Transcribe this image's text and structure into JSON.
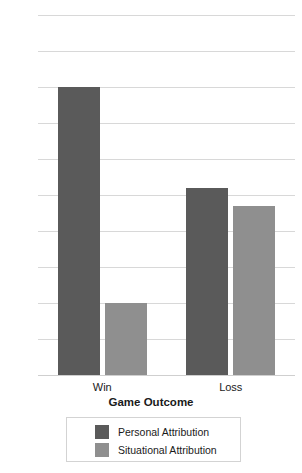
{
  "chart_data": {
    "type": "bar",
    "title": "",
    "xlabel": "Game Outcome",
    "ylabel": "",
    "categories": [
      "Win",
      "Loss"
    ],
    "series": [
      {
        "name": "Personal Attribution",
        "values": [
          80,
          52
        ],
        "color": "#5a5a5a"
      },
      {
        "name": "Situational Attribution",
        "values": [
          20,
          47
        ],
        "color": "#8f8f8f"
      }
    ],
    "ylim": [
      0,
      100
    ],
    "yticks": [
      0,
      10,
      20,
      30,
      40,
      50,
      60,
      70,
      80,
      90,
      100
    ],
    "ytick_labels": [
      "0",
      "10",
      "20",
      "30",
      "40",
      "50",
      "60",
      "70",
      "80",
      "90",
      "100"
    ],
    "grid": true,
    "legend_position": "bottom",
    "gridline_color": "#d8d8d8"
  },
  "legend": {
    "entries": [
      {
        "label": "Personal Attribution"
      },
      {
        "label": "Situational Attribution"
      }
    ]
  },
  "axes": {
    "x_title": "Game Outcome"
  }
}
